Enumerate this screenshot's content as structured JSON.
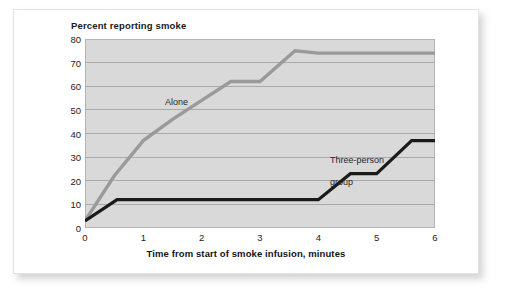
{
  "chart_data": {
    "type": "line",
    "title": "Percent reporting smoke",
    "xlabel": "Time from start of smoke infusion, minutes",
    "ylabel": "Percent reporting smoke",
    "xlim": [
      0,
      6
    ],
    "ylim": [
      0,
      80
    ],
    "xticks": [
      "0",
      "1",
      "2",
      "3",
      "4",
      "5",
      "6"
    ],
    "yticks": [
      "0",
      "10",
      "20",
      "30",
      "40",
      "50",
      "60",
      "70",
      "80"
    ],
    "grid": true,
    "legend_position": "inline-annotations",
    "series": [
      {
        "name": "Alone",
        "color": "#9a9a9a",
        "annotation": "Alone",
        "points": [
          {
            "x": 0.0,
            "y": 3
          },
          {
            "x": 0.5,
            "y": 22
          },
          {
            "x": 1.0,
            "y": 37
          },
          {
            "x": 1.5,
            "y": 46
          },
          {
            "x": 2.0,
            "y": 54
          },
          {
            "x": 2.5,
            "y": 62
          },
          {
            "x": 3.0,
            "y": 62
          },
          {
            "x": 3.6,
            "y": 75
          },
          {
            "x": 4.0,
            "y": 74
          },
          {
            "x": 6.0,
            "y": 74
          }
        ]
      },
      {
        "name": "Three-person group",
        "color": "#1a1a1a",
        "annotation": "Three-person\ngroup",
        "points": [
          {
            "x": 0.0,
            "y": 3
          },
          {
            "x": 0.55,
            "y": 12
          },
          {
            "x": 4.0,
            "y": 12
          },
          {
            "x": 4.55,
            "y": 23
          },
          {
            "x": 5.0,
            "y": 23
          },
          {
            "x": 5.6,
            "y": 37
          },
          {
            "x": 6.0,
            "y": 37
          }
        ]
      }
    ]
  },
  "annotations": {
    "alone_label": "Alone",
    "group_label_line1": "Three-person",
    "group_label_line2": "group"
  }
}
